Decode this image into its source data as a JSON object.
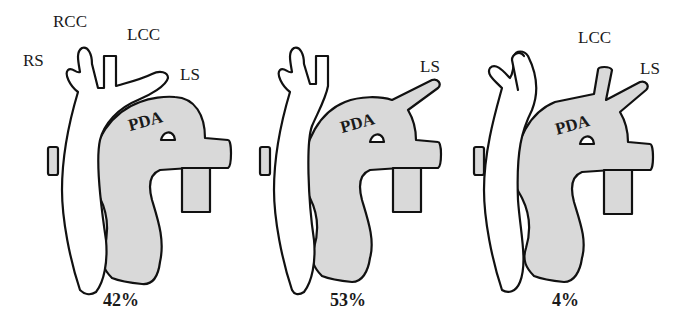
{
  "figure": {
    "panels": [
      {
        "id": "panel-1",
        "vessel_labels": [
          "RS",
          "RCC",
          "LCC",
          "LS"
        ],
        "duct_label": "PDA",
        "percentage": "42%"
      },
      {
        "id": "panel-2",
        "vessel_labels": [
          "LS"
        ],
        "duct_label": "PDA",
        "percentage": "53%"
      },
      {
        "id": "panel-3",
        "vessel_labels": [
          "LCC",
          "LS"
        ],
        "duct_label": "PDA",
        "percentage": "4%"
      }
    ]
  },
  "colors": {
    "vessel_fill": "#ffffff",
    "shaded_fill": "#d9d9d9",
    "outline": "#111111"
  }
}
